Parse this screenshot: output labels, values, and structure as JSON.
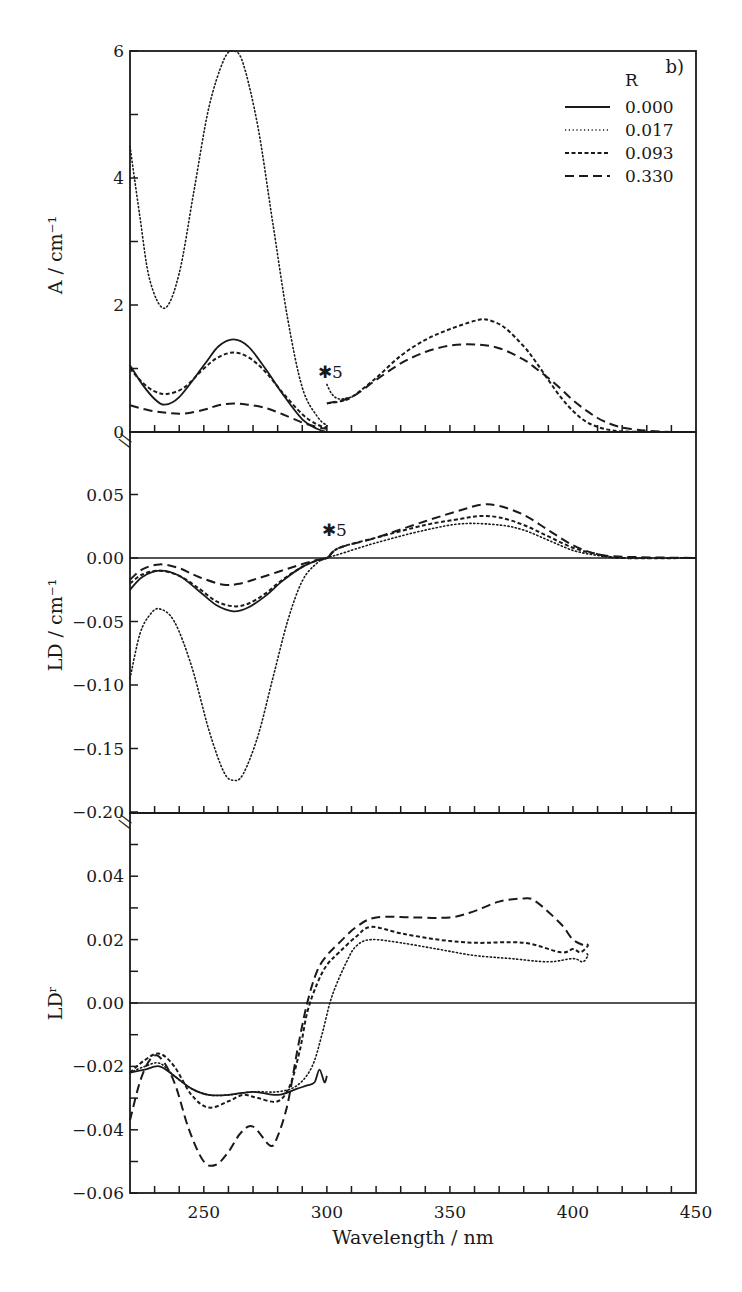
{
  "figure": {
    "panel_tag": "b)",
    "xlabel": "Wavelength / nm",
    "scale_marker": "✱5",
    "legend": {
      "title": "R",
      "entries": [
        {
          "label": "0.000",
          "style": "solid"
        },
        {
          "label": "0.017",
          "style": "dotted"
        },
        {
          "label": "0.093",
          "style": "short-dash"
        },
        {
          "label": "0.330",
          "style": "long-dash"
        }
      ]
    }
  },
  "chart_data": [
    {
      "type": "line",
      "panel": "top",
      "title": "",
      "xlabel": "Wavelength / nm",
      "ylabel": "A / cm⁻¹",
      "xlim": [
        220,
        450
      ],
      "ylim": [
        0,
        6
      ],
      "xticks": [
        250,
        300,
        350,
        400,
        450
      ],
      "yticks": [
        0,
        2,
        4,
        6
      ],
      "yticklabels": [
        "0",
        "2",
        "4",
        "6"
      ],
      "grid": false,
      "legend_position": "upper right",
      "legend_title": "R",
      "annotations": [
        {
          "text": "✱5",
          "x": 298,
          "y": 0.95,
          "note": "data above 300 nm scaled ×5"
        }
      ],
      "series": [
        {
          "name": "0.000",
          "style": "solid",
          "x": [
            220,
            225,
            230,
            234,
            240,
            250,
            256,
            262,
            268,
            275,
            282,
            290,
            296,
            300
          ],
          "y": [
            1.05,
            0.75,
            0.52,
            0.43,
            0.55,
            1.05,
            1.35,
            1.46,
            1.35,
            1.0,
            0.6,
            0.2,
            0.05,
            0.0
          ]
        },
        {
          "name": "0.017",
          "style": "dotted",
          "x": [
            220,
            224,
            228,
            234,
            240,
            246,
            252,
            258,
            262,
            266,
            272,
            278,
            284,
            290,
            296,
            300
          ],
          "y": [
            4.5,
            3.4,
            2.4,
            1.95,
            2.5,
            3.8,
            5.1,
            5.85,
            6.0,
            5.8,
            4.8,
            3.3,
            1.8,
            0.7,
            0.25,
            0.1
          ]
        },
        {
          "name": "0.093",
          "style": "short-dash",
          "x": [
            220,
            225,
            230,
            235,
            242,
            250,
            256,
            262,
            268,
            275,
            282,
            290,
            296,
            300
          ],
          "y": [
            1.0,
            0.78,
            0.64,
            0.6,
            0.7,
            1.0,
            1.18,
            1.25,
            1.18,
            0.95,
            0.62,
            0.28,
            0.12,
            0.07
          ]
        },
        {
          "name": "0.330",
          "style": "long-dash",
          "x": [
            220,
            228,
            235,
            242,
            250,
            256,
            262,
            268,
            275,
            282,
            290,
            296,
            300
          ],
          "y": [
            0.42,
            0.34,
            0.3,
            0.29,
            0.35,
            0.42,
            0.45,
            0.43,
            0.38,
            0.28,
            0.15,
            0.08,
            0.05
          ]
        },
        {
          "name": "0.000/0.093 (×5)",
          "style": "short-dash",
          "x": [
            300,
            305,
            310,
            320,
            330,
            340,
            350,
            360,
            365,
            372,
            380,
            385,
            390,
            395,
            400,
            405,
            410,
            415,
            420,
            430,
            450
          ],
          "y": [
            0.45,
            0.48,
            0.55,
            0.85,
            1.2,
            1.45,
            1.62,
            1.75,
            1.77,
            1.65,
            1.35,
            1.1,
            0.82,
            0.55,
            0.33,
            0.17,
            0.08,
            0.03,
            0.01,
            0.0,
            0.0
          ]
        },
        {
          "name": "0.017 (×5)",
          "style": "dotted",
          "x": [
            300,
            302,
            305,
            310
          ],
          "y": [
            0.75,
            0.6,
            0.52,
            0.55
          ]
        },
        {
          "name": "0.330 (×5)",
          "style": "long-dash",
          "x": [
            300,
            310,
            320,
            330,
            340,
            350,
            360,
            370,
            380,
            385,
            390,
            395,
            400,
            405,
            410,
            415,
            420,
            425,
            430,
            440,
            450
          ],
          "y": [
            0.45,
            0.55,
            0.82,
            1.08,
            1.26,
            1.36,
            1.38,
            1.32,
            1.14,
            1.0,
            0.85,
            0.68,
            0.5,
            0.35,
            0.22,
            0.13,
            0.07,
            0.04,
            0.02,
            0.0,
            0.0
          ]
        }
      ]
    },
    {
      "type": "line",
      "panel": "middle",
      "title": "",
      "xlabel": "Wavelength / nm",
      "ylabel": "LD / cm⁻¹",
      "xlim": [
        220,
        450
      ],
      "ylim": [
        -0.2,
        0.09
      ],
      "yticks": [
        -0.2,
        -0.15,
        -0.1,
        -0.05,
        0.0,
        0.05
      ],
      "yticklabels": [
        "−0.20",
        "−0.15",
        "−0.10",
        "−0.05",
        "0.00",
        "0.05"
      ],
      "zero_line": true,
      "grid": false,
      "annotations": [
        {
          "text": "✱5",
          "x": 300,
          "y": 0.025,
          "note": "data above 300 nm scaled ×5"
        }
      ],
      "series": [
        {
          "name": "0.000",
          "style": "solid",
          "x": [
            220,
            225,
            232,
            240,
            248,
            255,
            262,
            268,
            275,
            282,
            290,
            296,
            300
          ],
          "y": [
            -0.025,
            -0.015,
            -0.01,
            -0.014,
            -0.026,
            -0.037,
            -0.042,
            -0.039,
            -0.03,
            -0.018,
            -0.007,
            -0.002,
            0.0
          ]
        },
        {
          "name": "0.017",
          "style": "dotted",
          "x": [
            220,
            224,
            228,
            232,
            238,
            245,
            252,
            258,
            262,
            266,
            272,
            278,
            284,
            290,
            296,
            300,
            305,
            320,
            340,
            355,
            370,
            380,
            390,
            400,
            410,
            420,
            450
          ],
          "y": [
            -0.095,
            -0.06,
            -0.045,
            -0.04,
            -0.05,
            -0.085,
            -0.135,
            -0.168,
            -0.175,
            -0.17,
            -0.14,
            -0.095,
            -0.05,
            -0.018,
            -0.004,
            0.0,
            0.003,
            0.012,
            0.022,
            0.027,
            0.026,
            0.022,
            0.014,
            0.006,
            0.002,
            0.0,
            0.0
          ]
        },
        {
          "name": "0.093",
          "style": "short-dash",
          "x": [
            220,
            225,
            232,
            240,
            248,
            255,
            262,
            268,
            275,
            282,
            290,
            296,
            300,
            305,
            320,
            340,
            355,
            362,
            370,
            380,
            390,
            400,
            410,
            420,
            450
          ],
          "y": [
            -0.02,
            -0.013,
            -0.01,
            -0.014,
            -0.024,
            -0.034,
            -0.038,
            -0.036,
            -0.028,
            -0.017,
            -0.007,
            -0.002,
            0.0,
            0.008,
            0.016,
            0.026,
            0.031,
            0.033,
            0.032,
            0.026,
            0.017,
            0.008,
            0.003,
            0.0,
            0.0
          ]
        },
        {
          "name": "0.330",
          "style": "long-dash",
          "x": [
            220,
            225,
            232,
            240,
            248,
            258,
            265,
            272,
            280,
            288,
            295,
            300,
            305,
            320,
            340,
            355,
            363,
            370,
            380,
            390,
            400,
            410,
            420,
            450
          ],
          "y": [
            -0.017,
            -0.009,
            -0.005,
            -0.008,
            -0.015,
            -0.021,
            -0.02,
            -0.016,
            -0.011,
            -0.006,
            -0.002,
            0.0,
            0.008,
            0.016,
            0.029,
            0.038,
            0.042,
            0.041,
            0.034,
            0.022,
            0.01,
            0.003,
            0.001,
            0.0
          ]
        }
      ]
    },
    {
      "type": "line",
      "panel": "bottom",
      "title": "",
      "xlabel": "Wavelength / nm",
      "ylabel": "LDʳ",
      "xlim": [
        220,
        450
      ],
      "ylim": [
        -0.06,
        0.06
      ],
      "xticks": [
        250,
        300,
        350,
        400,
        450
      ],
      "xticklabels": [
        "250",
        "300",
        "350",
        "400",
        "450"
      ],
      "yticks": [
        -0.06,
        -0.04,
        -0.02,
        0.0,
        0.02,
        0.04
      ],
      "yticklabels": [
        "−0.06",
        "−0.04",
        "−0.02",
        "0.00",
        "0.02",
        "0.04"
      ],
      "zero_line": true,
      "grid": false,
      "series": [
        {
          "name": "0.000",
          "style": "solid",
          "x": [
            220,
            226,
            232,
            238,
            245,
            252,
            260,
            270,
            280,
            288,
            292,
            295,
            297,
            299,
            300
          ],
          "y": [
            -0.022,
            -0.021,
            -0.02,
            -0.023,
            -0.027,
            -0.029,
            -0.029,
            -0.028,
            -0.029,
            -0.027,
            -0.026,
            -0.025,
            -0.021,
            -0.025,
            -0.023
          ]
        },
        {
          "name": "0.017",
          "style": "dotted",
          "x": [
            220,
            226,
            232,
            238,
            245,
            252,
            260,
            270,
            280,
            288,
            294,
            298,
            302,
            308,
            312,
            318,
            330,
            345,
            360,
            375,
            390,
            400,
            404,
            406,
            405
          ],
          "y": [
            -0.022,
            -0.02,
            -0.019,
            -0.023,
            -0.027,
            -0.029,
            -0.029,
            -0.028,
            -0.028,
            -0.026,
            -0.02,
            -0.01,
            0.002,
            0.013,
            0.018,
            0.02,
            0.019,
            0.017,
            0.015,
            0.014,
            0.013,
            0.014,
            0.013,
            0.015,
            0.016
          ]
        },
        {
          "name": "0.093",
          "style": "short-dash",
          "x": [
            220,
            226,
            232,
            238,
            245,
            252,
            260,
            266,
            272,
            280,
            285,
            289,
            292,
            296,
            300,
            305,
            312,
            318,
            330,
            345,
            360,
            380,
            395,
            400,
            403,
            406,
            405
          ],
          "y": [
            -0.022,
            -0.018,
            -0.016,
            -0.02,
            -0.029,
            -0.033,
            -0.031,
            -0.029,
            -0.03,
            -0.031,
            -0.026,
            -0.015,
            -0.003,
            0.006,
            0.012,
            0.016,
            0.021,
            0.024,
            0.022,
            0.02,
            0.019,
            0.019,
            0.016,
            0.017,
            0.016,
            0.018,
            0.019
          ]
        },
        {
          "name": "0.330",
          "style": "long-dash",
          "x": [
            220,
            224,
            228,
            232,
            238,
            244,
            250,
            255,
            260,
            265,
            270,
            277,
            280,
            284,
            288,
            292,
            296,
            300,
            305,
            312,
            320,
            335,
            350,
            360,
            370,
            380,
            385,
            395,
            400,
            405
          ],
          "y": [
            -0.037,
            -0.025,
            -0.018,
            -0.017,
            -0.025,
            -0.04,
            -0.05,
            -0.051,
            -0.047,
            -0.041,
            -0.039,
            -0.045,
            -0.042,
            -0.032,
            -0.015,
            0.0,
            0.01,
            0.015,
            0.019,
            0.024,
            0.027,
            0.027,
            0.027,
            0.029,
            0.032,
            0.033,
            0.032,
            0.025,
            0.02,
            0.018
          ]
        }
      ]
    }
  ]
}
